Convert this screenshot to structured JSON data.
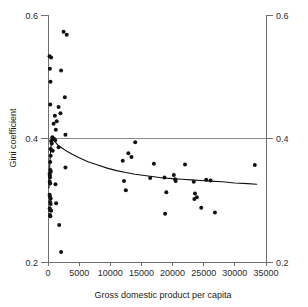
{
  "chart_data": {
    "type": "scatter",
    "title": "",
    "xlabel": "Gross domestic product per capita",
    "ylabel": "Gini coefficient",
    "xlim": [
      0,
      35000
    ],
    "ylim": [
      0.2,
      0.6
    ],
    "xticks": [
      0,
      5000,
      10000,
      15000,
      20000,
      25000,
      30000,
      35000
    ],
    "xtick_labels": [
      "0",
      "5000",
      "10000",
      "15000",
      "20000",
      "25000",
      "30000",
      "35000"
    ],
    "yticks": [
      0.2,
      0.4,
      0.6
    ],
    "ytick_labels": [
      "0.2",
      "0.4",
      "0.6"
    ],
    "yticks_right": [
      0.2,
      0.4,
      0.6
    ],
    "ytick_labels_right": [
      "0.2",
      "0.4",
      "0.6"
    ],
    "gridlines_y": [
      0.4
    ],
    "grid": true,
    "legend": null,
    "legend_position": "none",
    "point_color": "#111111",
    "line_color": "#111111",
    "axis_color": "#6f6f6f",
    "background": "#ffffff",
    "series": [
      {
        "name": "Countries",
        "marker": "circle",
        "points": [
          [
            2500,
            0.573
          ],
          [
            3000,
            0.568
          ],
          [
            250,
            0.533
          ],
          [
            500,
            0.531
          ],
          [
            300,
            0.513
          ],
          [
            2100,
            0.51
          ],
          [
            400,
            0.492
          ],
          [
            2700,
            0.467
          ],
          [
            350,
            0.455
          ],
          [
            1700,
            0.451
          ],
          [
            2000,
            0.441
          ],
          [
            1100,
            0.437
          ],
          [
            1400,
            0.428
          ],
          [
            900,
            0.424
          ],
          [
            1250,
            0.414
          ],
          [
            2800,
            0.406
          ],
          [
            700,
            0.402
          ],
          [
            820,
            0.4
          ],
          [
            1000,
            0.399
          ],
          [
            1150,
            0.397
          ],
          [
            500,
            0.396
          ],
          [
            600,
            0.392
          ],
          [
            14000,
            0.394
          ],
          [
            1700,
            0.386
          ],
          [
            420,
            0.383
          ],
          [
            750,
            0.38
          ],
          [
            12900,
            0.376
          ],
          [
            430,
            0.372
          ],
          [
            13400,
            0.37
          ],
          [
            12000,
            0.364
          ],
          [
            350,
            0.362
          ],
          [
            17000,
            0.359
          ],
          [
            22000,
            0.358
          ],
          [
            33200,
            0.357
          ],
          [
            2800,
            0.353
          ],
          [
            380,
            0.349
          ],
          [
            450,
            0.346
          ],
          [
            260,
            0.343
          ],
          [
            300,
            0.34
          ],
          [
            20200,
            0.341
          ],
          [
            320,
            0.337
          ],
          [
            16400,
            0.336
          ],
          [
            18700,
            0.337
          ],
          [
            20400,
            0.334
          ],
          [
            20500,
            0.331
          ],
          [
            23400,
            0.33
          ],
          [
            25400,
            0.333
          ],
          [
            26100,
            0.332
          ],
          [
            12200,
            0.331
          ],
          [
            280,
            0.33
          ],
          [
            350,
            0.327
          ],
          [
            1200,
            0.326
          ],
          [
            12500,
            0.316
          ],
          [
            19000,
            0.313
          ],
          [
            23600,
            0.311
          ],
          [
            23900,
            0.305
          ],
          [
            23500,
            0.302
          ],
          [
            260,
            0.309
          ],
          [
            300,
            0.306
          ],
          [
            430,
            0.303
          ],
          [
            330,
            0.297
          ],
          [
            420,
            0.294
          ],
          [
            1300,
            0.295
          ],
          [
            24600,
            0.288
          ],
          [
            280,
            0.287
          ],
          [
            350,
            0.284
          ],
          [
            500,
            0.283
          ],
          [
            18800,
            0.278
          ],
          [
            26800,
            0.28
          ],
          [
            300,
            0.276
          ],
          [
            380,
            0.274
          ],
          [
            1800,
            0.26
          ],
          [
            2100,
            0.216
          ]
        ]
      }
    ],
    "trend_line": {
      "name": "Fitted curve",
      "points": [
        [
          150,
          0.32
        ],
        [
          300,
          0.362
        ],
        [
          450,
          0.385
        ],
        [
          600,
          0.397
        ],
        [
          750,
          0.401
        ],
        [
          900,
          0.399
        ],
        [
          1200,
          0.394
        ],
        [
          1600,
          0.389
        ],
        [
          2200,
          0.385
        ],
        [
          2900,
          0.38
        ],
        [
          3800,
          0.375
        ],
        [
          5000,
          0.369
        ],
        [
          6500,
          0.362
        ],
        [
          8000,
          0.357
        ],
        [
          9500,
          0.352
        ],
        [
          11000,
          0.348
        ],
        [
          12500,
          0.345
        ],
        [
          14000,
          0.342
        ],
        [
          15500,
          0.34
        ],
        [
          17000,
          0.338
        ],
        [
          18500,
          0.336
        ],
        [
          20000,
          0.335
        ],
        [
          21500,
          0.334
        ],
        [
          23000,
          0.333
        ],
        [
          24500,
          0.332
        ],
        [
          26000,
          0.331
        ],
        [
          28000,
          0.33
        ],
        [
          30000,
          0.328
        ],
        [
          32000,
          0.327
        ],
        [
          33500,
          0.326
        ]
      ]
    }
  }
}
